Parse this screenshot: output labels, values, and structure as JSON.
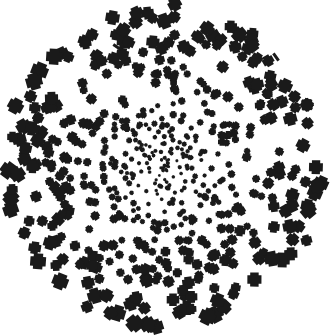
{
  "figure": {
    "title": "Radial cross-glyph scatter pattern",
    "width": 334,
    "height": 336,
    "background_color": "#ffffff",
    "ink_color": "#1a1a1a"
  },
  "chart_data": {
    "type": "scatter",
    "title": "Radial cross-glyph scatter pattern",
    "subtitle": "",
    "xlabel": "",
    "ylabel": "",
    "xlim": [
      0,
      334
    ],
    "ylim": [
      0,
      336
    ],
    "grid": false,
    "legend": "none",
    "axes_visible": false,
    "tick_labels_x": [],
    "tick_labels_y": [],
    "annotations": [],
    "marker": {
      "shape": "cross",
      "fill": "#1a1a1a",
      "stroke": "none",
      "arm_ratio": 0.3,
      "rotation": "random",
      "rotation_range_deg": [
        0,
        90
      ],
      "size_min_px": 3.0,
      "size_max_px": 13.5,
      "size_rule": "increases linearly with radial distance from center"
    },
    "distribution": {
      "family": "radial-density-gradient",
      "center_x": 165,
      "center_y": 166,
      "max_radius_px": 158,
      "density_rule": "point count per unit area decreases with radius; ~uniform in radius rather than area",
      "n_points": 620,
      "seed": 20250419
    },
    "series": [
      {
        "name": "crosses",
        "color": "#1a1a1a",
        "n": 620
      }
    ],
    "outliers": [
      {
        "x": 234,
        "y": 45,
        "kind": "partial-stroke",
        "angle_deg": 40,
        "length_px": 10
      },
      {
        "x": 276,
        "y": 57,
        "kind": "partial-stroke",
        "angle_deg": 55,
        "length_px": 9
      },
      {
        "x": 117,
        "y": 47,
        "kind": "partial-stroke",
        "angle_deg": 35,
        "length_px": 9
      }
    ]
  }
}
